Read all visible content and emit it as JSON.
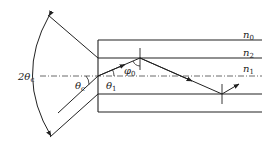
{
  "diagram": {
    "labels": {
      "acceptance_angle": {
        "main": "2θ",
        "sub": "c"
      },
      "critical_angle": {
        "main": "θ",
        "sub": "c"
      },
      "refraction_angle": {
        "main": "θ",
        "sub": "1"
      },
      "incidence_angle": {
        "main": "φ",
        "sub": "0"
      },
      "n0": {
        "main": "n",
        "sub": "0"
      },
      "n2": {
        "main": "n",
        "sub": "2"
      },
      "n1": {
        "main": "n",
        "sub": "1"
      }
    },
    "colors": {
      "line": "#222222",
      "background": "#ffffff"
    }
  }
}
